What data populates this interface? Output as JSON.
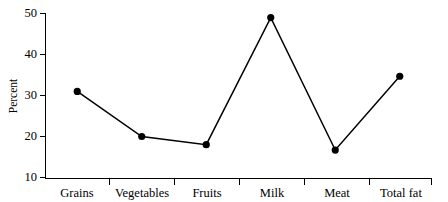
{
  "chart_data": {
    "type": "line",
    "title": "",
    "xlabel": "",
    "ylabel": "Percent",
    "categories": [
      "Grains",
      "Vegetables",
      "Fruits",
      "Milk",
      "Meat",
      "Total fat"
    ],
    "values": [
      31,
      20,
      18,
      49,
      16.7,
      34.7
    ],
    "series": [
      {
        "name": "Percent",
        "values": [
          31,
          20,
          18,
          49,
          16.7,
          34.7
        ]
      }
    ],
    "ylim": [
      10,
      50
    ],
    "yticks": [
      10,
      20,
      30,
      40,
      50
    ],
    "ytick_labels": [
      "10",
      "20",
      "30",
      "40",
      "50"
    ],
    "xtick_labels": [
      "Grains",
      "Vegetables",
      "Fruits",
      "Milk",
      "Meat",
      "Total fat"
    ],
    "grid": false,
    "legend": "none",
    "marker": "filled-circle",
    "line_color": "#000000",
    "marker_color": "#000000",
    "background_color": "#ffffff"
  },
  "axes": {
    "y_title": "Percent",
    "y_labels": {
      "t50": "50",
      "t40": "40",
      "t30": "30",
      "t20": "20",
      "t10": "10"
    },
    "x_labels": {
      "c0": "Grains",
      "c1": "Vegetables",
      "c2": "Fruits",
      "c3": "Milk",
      "c4": "Meat",
      "c5": "Total fat"
    }
  }
}
